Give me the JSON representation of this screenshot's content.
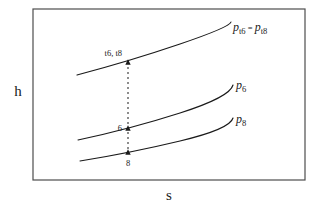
{
  "figure": {
    "kind": "enthalpy-entropy-diagram",
    "axes": {
      "y_label": "h",
      "x_label": "s"
    },
    "frame": {
      "x": 33,
      "y": 9,
      "width": 272,
      "height": 171,
      "color": "#4d4d4d"
    },
    "curves": [
      {
        "id": "total-pressure-line",
        "label_main": "p",
        "label_sub": "t6",
        "label_eq": " = ",
        "label_main2": "p",
        "label_sub2": "t8",
        "label_text": "pt6 = pt8",
        "label_x": 233,
        "label_y": 31,
        "path": "M 77 75 Q 130 61 180 44 T 231 22"
      },
      {
        "id": "static-pressure-6-line",
        "label_main": "p",
        "label_sub": "6",
        "label_text": "p6",
        "label_x": 236,
        "label_y": 89,
        "path": "M 78 140 Q 130 129 180 113 T 233 85"
      },
      {
        "id": "static-pressure-8-line",
        "label_main": "p",
        "label_sub": "8",
        "label_text": "p8",
        "label_x": 236,
        "label_y": 123,
        "path": "M 80 161 Q 130 153 180 141 T 233 118"
      }
    ],
    "connector": {
      "id": "vertical-dashed-connector",
      "x": 128,
      "y_top": 62,
      "y_bottom": 153
    },
    "points": [
      {
        "id": "state-t6-t8",
        "label": "t6, t8",
        "x": 128,
        "y": 62,
        "label_x": 122,
        "label_y": 56,
        "anchor": "end"
      },
      {
        "id": "state-6",
        "label": "6",
        "x": 128,
        "y": 128,
        "label_x": 122,
        "label_y": 131,
        "anchor": "end"
      },
      {
        "id": "state-8",
        "label": "8",
        "x": 128,
        "y": 152,
        "label_x": 128,
        "label_y": 166,
        "anchor": "middle"
      }
    ],
    "colors": {
      "ink": "#1a1a1a",
      "frame": "#4d4d4d",
      "background": "#ffffff"
    }
  }
}
